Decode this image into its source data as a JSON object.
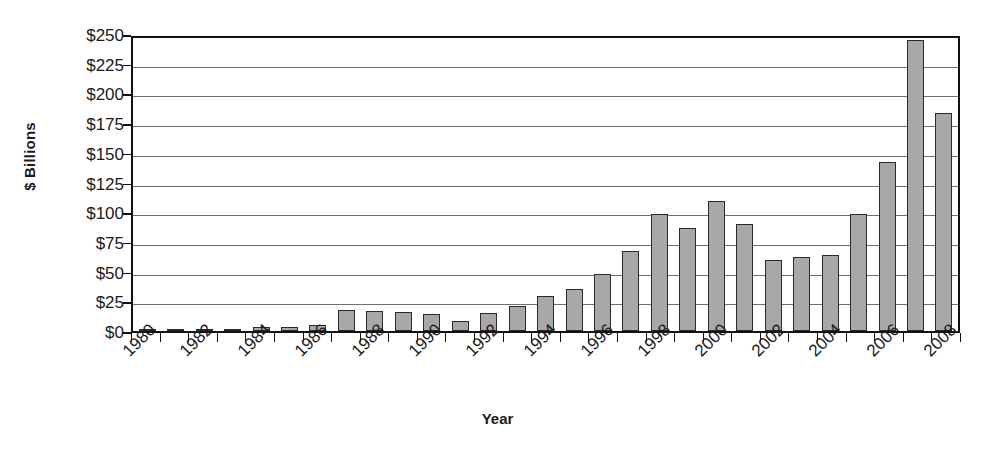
{
  "chart_data": {
    "type": "bar",
    "title": "",
    "xlabel": "Year",
    "ylabel": "$ Billions",
    "ylim": [
      0,
      250
    ],
    "ytick_values": [
      0,
      25,
      50,
      75,
      100,
      125,
      150,
      175,
      200,
      225,
      250
    ],
    "ytick_labels": [
      "$0",
      "$25",
      "$50",
      "$75",
      "$100",
      "$125",
      "$150",
      "$175",
      "$200",
      "$225",
      "$250"
    ],
    "grid": true,
    "legend": "none",
    "bar_color": "#a8a8a8",
    "bar_border_color": "#2a2a2a",
    "axis_color": "#111111",
    "gridline_color": "#6e6e6e",
    "categories": [
      "1980",
      "1981",
      "1982",
      "1983",
      "1984",
      "1985",
      "1986",
      "1987",
      "1988",
      "1989",
      "1990",
      "1991",
      "1992",
      "1993",
      "1994",
      "1995",
      "1996",
      "1997",
      "1998",
      "1999",
      "2000",
      "2001",
      "2002",
      "2003",
      "2004",
      "2005",
      "2006",
      "2007",
      "2008"
    ],
    "xtick_labels_shown": [
      "1980",
      "1982",
      "1984",
      "1986",
      "1988",
      "1990",
      "1992",
      "1994",
      "1996",
      "1998",
      "2000",
      "2002",
      "2004",
      "2006",
      "2008"
    ],
    "values": [
      0.5,
      1,
      1.5,
      2,
      3,
      3.5,
      5.5,
      18,
      17,
      16.5,
      14,
      8.5,
      15.5,
      21.5,
      29.5,
      36,
      48,
      68,
      99,
      87,
      110,
      91,
      60,
      63,
      64,
      99.5,
      143,
      247,
      185
    ]
  }
}
